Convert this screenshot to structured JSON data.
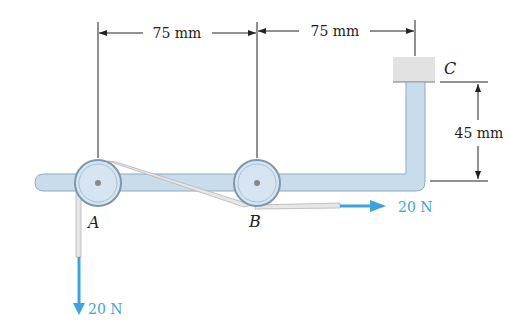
{
  "diagram": {
    "type": "mechanics-figure",
    "dimensions": [
      {
        "id": "AB",
        "label": "75 mm"
      },
      {
        "id": "BC",
        "label": "75 mm"
      },
      {
        "id": "C-height",
        "label": "45 mm"
      }
    ],
    "points": [
      {
        "id": "A",
        "label": "A"
      },
      {
        "id": "B",
        "label": "B"
      },
      {
        "id": "C",
        "label": "C"
      }
    ],
    "forces": [
      {
        "id": "force-horizontal",
        "label": "20 N",
        "direction": "right",
        "at": "B"
      },
      {
        "id": "force-vertical",
        "label": "20 N",
        "direction": "down",
        "at": "A"
      }
    ],
    "colors": {
      "bracket_fill": "#c9dcec",
      "bracket_stroke": "#8fa9c0",
      "pulley_fill": "#d8e6f2",
      "pulley_stroke": "#7f97ad",
      "belt": "#e4e4e4",
      "support": "#e2e2e2",
      "force_arrow": "#3ba3dd",
      "dimension_line": "#222222"
    }
  }
}
